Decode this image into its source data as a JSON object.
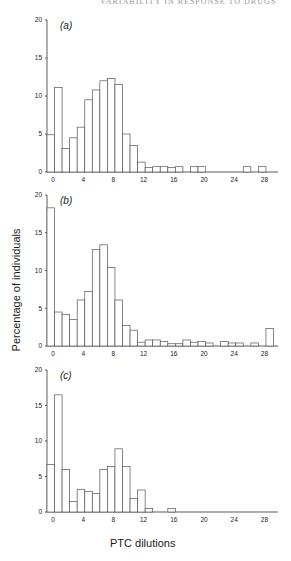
{
  "header": "VARIABILITY IN RESPONSE TO DRUGS",
  "ylabel": "Percentage of individuals",
  "xlabel": "PTC dilutions",
  "chart_data": [
    {
      "type": "bar",
      "panel": "(a)",
      "title": "(a)",
      "xlabel": "PTC dilutions",
      "ylabel": "Percentage of individuals",
      "ylim": [
        0,
        20
      ],
      "yticks": [
        0,
        5,
        10,
        15,
        20
      ],
      "xticks": [
        0,
        4,
        8,
        12,
        16,
        20,
        24,
        28
      ],
      "grid": false,
      "categories": [
        0,
        1,
        2,
        3,
        4,
        5,
        6,
        7,
        8,
        9,
        10,
        11,
        12,
        13,
        14,
        15,
        16,
        17,
        18,
        19,
        20,
        21,
        22,
        23,
        24,
        25,
        26,
        27,
        28
      ],
      "values": [
        4.9,
        11.1,
        3.1,
        4.5,
        5.9,
        9.5,
        10.8,
        12.0,
        12.3,
        11.5,
        5.0,
        3.5,
        1.3,
        0.6,
        0.7,
        0.7,
        0.6,
        0.7,
        0,
        0.7,
        0.7,
        0,
        0,
        0,
        0,
        0,
        0.7,
        0,
        0.7
      ]
    },
    {
      "type": "bar",
      "panel": "(b)",
      "title": "(b)",
      "xlabel": "PTC dilutions",
      "ylabel": "Percentage of individuals",
      "ylim": [
        0,
        20
      ],
      "yticks": [
        0,
        5,
        10,
        15,
        20
      ],
      "xticks": [
        0,
        4,
        8,
        12,
        16,
        20,
        24,
        28
      ],
      "grid": false,
      "categories": [
        0,
        1,
        2,
        3,
        4,
        5,
        6,
        7,
        8,
        9,
        10,
        11,
        12,
        13,
        14,
        15,
        16,
        17,
        18,
        19,
        20,
        21,
        22,
        23,
        24,
        25,
        26,
        27,
        28,
        29
      ],
      "values": [
        18.3,
        4.5,
        4.2,
        3.5,
        6.1,
        7.2,
        12.8,
        13.4,
        10.4,
        6.1,
        2.7,
        2.1,
        0.5,
        0.8,
        0.8,
        0.6,
        0.3,
        0.3,
        0.8,
        0.5,
        0.6,
        0.4,
        0,
        0.6,
        0.4,
        0.4,
        0,
        0.4,
        0,
        2.3
      ]
    },
    {
      "type": "bar",
      "panel": "(c)",
      "title": "(c)",
      "xlabel": "PTC dilutions",
      "ylabel": "Percentage of individuals",
      "ylim": [
        0,
        20
      ],
      "yticks": [
        0,
        5,
        10,
        15,
        20
      ],
      "xticks": [
        0,
        4,
        8,
        12,
        16,
        20,
        24,
        28
      ],
      "grid": false,
      "categories": [
        0,
        1,
        2,
        3,
        4,
        5,
        6,
        7,
        8,
        9,
        10,
        11,
        12,
        13,
        14,
        15,
        16
      ],
      "values": [
        6.7,
        16.5,
        6.0,
        1.5,
        3.2,
        2.9,
        2.6,
        6.0,
        6.4,
        8.9,
        6.4,
        1.9,
        3.1,
        0.5,
        0,
        0,
        0.5
      ]
    }
  ]
}
